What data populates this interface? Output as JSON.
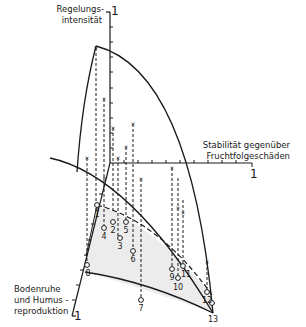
{
  "axes": {
    "vertical": {
      "label_line1": "Regelungs-",
      "label_line2": "intensität",
      "max_label": "1"
    },
    "horizontal": {
      "label_line1": "Stabilität gegenüber",
      "label_line2": "Fruchtfolgeschäden",
      "max_label": "1"
    },
    "oblique": {
      "label_line1": "Bodenruhe",
      "label_line2": "und Humus -",
      "label_line3": "reproduktion",
      "max_label": "1"
    }
  },
  "points": [
    {
      "id": "1",
      "label": "1"
    },
    {
      "id": "2",
      "label": "2"
    },
    {
      "id": "3",
      "label": "3"
    },
    {
      "id": "4",
      "label": "4"
    },
    {
      "id": "5",
      "label": "5"
    },
    {
      "id": "6",
      "label": "6"
    },
    {
      "id": "7",
      "label": "7"
    },
    {
      "id": "8",
      "label": "8"
    },
    {
      "id": "9",
      "label": "9"
    },
    {
      "id": "10",
      "label": "10"
    },
    {
      "id": "11",
      "label": "11"
    },
    {
      "id": "12",
      "label": "12"
    },
    {
      "id": "13",
      "label": "13"
    }
  ],
  "colors": {
    "ink": "#1a1a1a",
    "shade": "#ececec",
    "background": "#ffffff"
  }
}
